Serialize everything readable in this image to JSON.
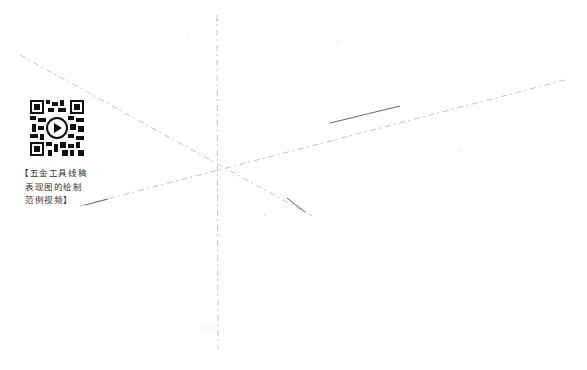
{
  "diagram": {
    "type": "perspective-sketch-construction-lines",
    "lines": [
      {
        "name": "vertical-axis",
        "x1": 217,
        "y1": 15,
        "x2": 218,
        "y2": 350
      },
      {
        "name": "right-receding-line",
        "x1": 80,
        "y1": 206,
        "x2": 565,
        "y2": 80
      },
      {
        "name": "left-receding-line",
        "x1": 20,
        "y1": 55,
        "x2": 312,
        "y2": 216
      }
    ],
    "stroke_color": "#9a9a9a"
  },
  "qr": {
    "icon": "qr-code-with-play-icon",
    "caption_lines": [
      "【五金工具线稿",
      "表现图的绘制",
      "范例视频】"
    ]
  }
}
